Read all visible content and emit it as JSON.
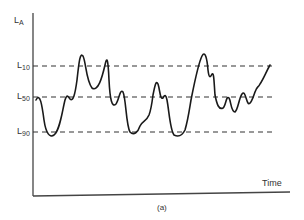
{
  "chart_data": {
    "type": "line",
    "title": "",
    "xlabel": "Time",
    "ylabel": "LA",
    "caption": "(a)",
    "reference_lines": [
      {
        "name": "L10",
        "label_main": "L",
        "label_sub": "10",
        "y": 66
      },
      {
        "name": "L50",
        "label_main": "L",
        "label_sub": "50",
        "y": 97
      },
      {
        "name": "L90",
        "label_main": "L",
        "label_sub": "90",
        "y": 132
      }
    ],
    "series": [
      {
        "name": "LA(t)",
        "path": "M36,100 C40,92 42,105 44,120 C46,134 50,138 54,135 C60,130 62,112 65,100 C67,94 68,96 70,99 C73,102 75,95 77,80 C79,62 80,52 83,56 C86,62 86,80 92,88 C98,92 102,78 105,65 C107,56 108,58 109,80 C110,100 112,108 116,104 C119,100 120,88 123,92 C126,98 126,125 130,132 C134,136 138,132 140,126 C143,120 146,122 149,115 C151,110 152,103 153,95 C155,85 156,80 158,84 C160,90 160,100 163,98 C165,94 166,95 167,100 C169,110 170,130 174,135 C178,137 182,136 185,130 C188,120 189,112 191,100 C194,85 198,64 202,56 C205,50 207,58 208,70 C209,78 210,78 212,74 C214,72 214,82 215,95 C217,105 219,110 223,108 C226,106 226,95 229,98 C231,101 231,112 235,112 C238,110 239,98 242,94 C245,90 246,100 248,103 C250,106 253,98 255,92 C257,86 258,88 260,84 C264,78 266,72 270,65"
      }
    ],
    "xlim": [
      0,
      1
    ],
    "ylim": [
      0,
      1
    ],
    "grid": false,
    "legend": "none"
  },
  "axes": {
    "y_label_main": "L",
    "y_label_sub": "A",
    "x_label": "Time",
    "caption": "(a)"
  },
  "colors": {
    "line": "#1a1a1a",
    "axis": "#444444",
    "dash": "#333333",
    "text": "#333333"
  }
}
